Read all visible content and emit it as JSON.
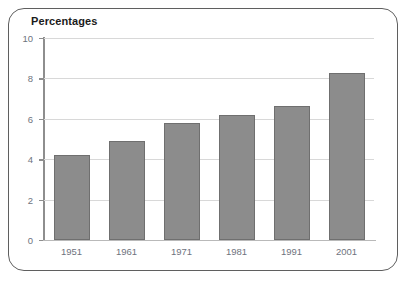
{
  "frame": {
    "border_color": "#5f5f5f"
  },
  "chart_data": {
    "type": "bar",
    "title": "Percentages",
    "xlabel": "",
    "ylabel": "",
    "categories": [
      "1951",
      "1961",
      "1971",
      "1981",
      "1991",
      "2001"
    ],
    "values": [
      4.2,
      4.9,
      5.8,
      6.2,
      6.65,
      8.25
    ],
    "ylim": [
      0,
      10
    ],
    "yticks": [
      0,
      2,
      4,
      6,
      8,
      10
    ],
    "ytick_labels": [
      "0",
      "2",
      "4",
      "6",
      "8",
      "10"
    ],
    "grid": true,
    "legend": false,
    "bar_color": "#8c8c8c",
    "bar_edge_color": "#6f6f6f",
    "gridline_color": "#d8d8d8",
    "axis_color": "#8e8e8e",
    "tick_label_color": "#6e737d",
    "title_color": "#1b1b1b"
  }
}
